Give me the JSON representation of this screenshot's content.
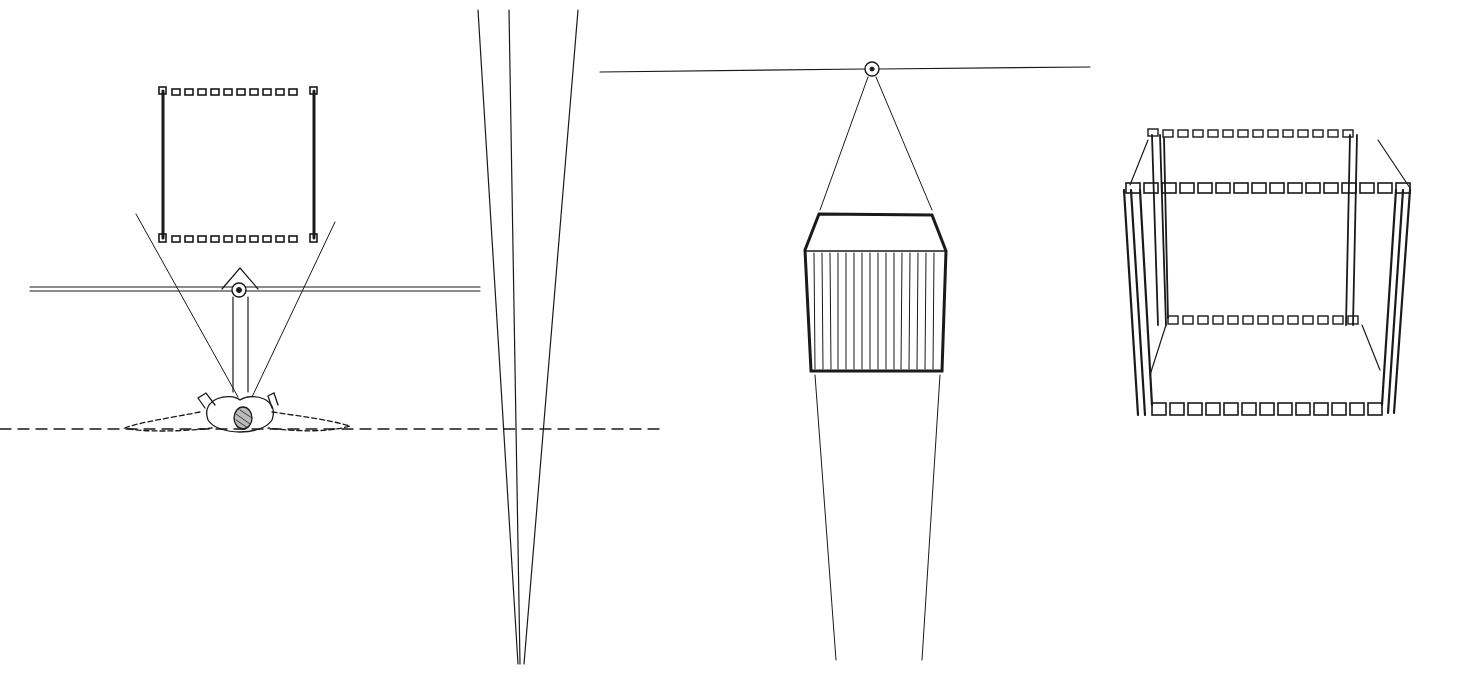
{
  "diagram": {
    "type": "perspective-line-drawing",
    "panels": [
      {
        "id": "plan-view",
        "description": "Top view of observer looking at square frame across picture plane"
      },
      {
        "id": "converging-lines",
        "description": "Three lines converging to a point at bottom"
      },
      {
        "id": "elevation-view",
        "description": "Eye point on horizon with hatched block in perspective"
      },
      {
        "id": "frame-cube",
        "description": "Perspective open cube frame made of posts and bead rows"
      }
    ],
    "colors": {
      "ink": "#1a1a1a",
      "background": "#ffffff"
    }
  }
}
